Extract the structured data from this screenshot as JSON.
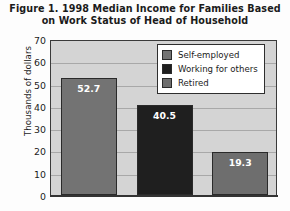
{
  "figure": {
    "title_lines": [
      "Figure 1.  1998 Median Income for Families Based",
      "on Work Status of Head of Household"
    ],
    "background_color": "#fdfdfd",
    "plot_background_color": "#d4d4d4",
    "frame_color": "#3a3a3a"
  },
  "chart_data": {
    "type": "bar",
    "title": "Figure 1.  1998 Median Income for Families Based on Work Status of Head of Household",
    "xlabel": "",
    "ylabel": "Thousands of dollars",
    "categories": [
      "Self-employed",
      "Working for others",
      "Retired"
    ],
    "values": [
      52.7,
      40.5,
      19.3
    ],
    "value_labels": [
      "52.7",
      "40.5",
      "19.3"
    ],
    "bar_colors": [
      "#737373",
      "#1f1f1f",
      "#6e6e6e"
    ],
    "ylim": [
      0,
      70
    ],
    "yticks": [
      0,
      10,
      20,
      30,
      40,
      50,
      60,
      70
    ],
    "ytick_labels": [
      "0",
      "10",
      "20",
      "30",
      "40",
      "50",
      "60",
      "70"
    ],
    "grid": true,
    "grid_axis": "y",
    "legend_position": "upper right",
    "legend_entries": [
      {
        "label": "Self-employed",
        "color": "#737373"
      },
      {
        "label": "Working for others",
        "color": "#1f1f1f"
      },
      {
        "label": "Retired",
        "color": "#6e6e6e"
      }
    ]
  }
}
